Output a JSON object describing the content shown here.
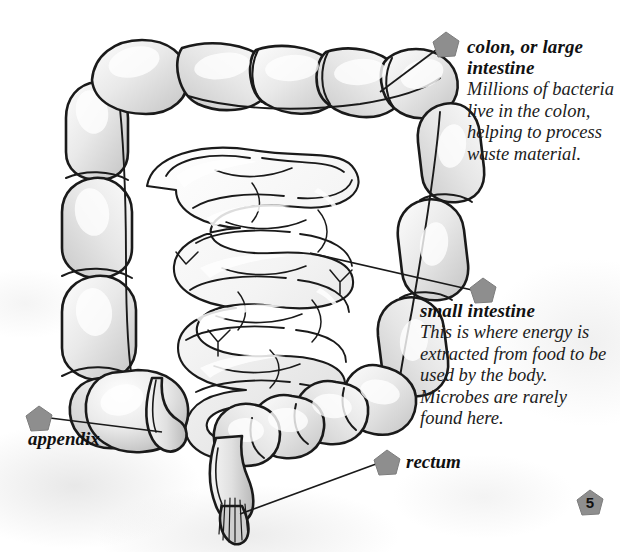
{
  "page": {
    "number": "5",
    "figure_title": "Human large and small intestine diagram"
  },
  "callouts": [
    {
      "id": "colon",
      "title": "colon, or large intestine",
      "body": "Millions of bacteria live in the colon, helping to process waste material.",
      "marker": "pentagon-marker"
    },
    {
      "id": "small-intestine",
      "title": "small intestine",
      "body": "This is where energy is extracted from food to be used by the body. Microbes are rarely found here.",
      "marker": "pentagon-marker"
    },
    {
      "id": "appendix",
      "title": "appendix",
      "body": "",
      "marker": "pentagon-marker"
    },
    {
      "id": "rectum",
      "title": "rectum",
      "body": "",
      "marker": "pentagon-marker"
    }
  ],
  "colors": {
    "outline": "#1a1a1a",
    "organ_fill_light": "#f2f2f2",
    "organ_fill_mid": "#d8d8d8",
    "organ_fill_dark": "#bdbdbd",
    "marker_gray": "#8e8e8e",
    "paper": "#ffffff",
    "text": "#111111"
  }
}
